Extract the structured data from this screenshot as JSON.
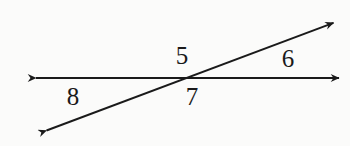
{
  "figure": {
    "background_color": "#fbfbfa",
    "stroke_color": "#1a1a1a",
    "canvas": {
      "width": 350,
      "height": 146
    },
    "intersection_point": {
      "x": 183,
      "y": 78
    },
    "lines": [
      {
        "name": "horizontal-line",
        "description": "double-headed horizontal line",
        "start": {
          "x": 30,
          "y": 78
        },
        "end": {
          "x": 345,
          "y": 78
        },
        "arrow_start": true,
        "arrow_end": true
      },
      {
        "name": "transversal-line",
        "description": "double-headed transversal rising to the right",
        "start": {
          "x": 40,
          "y": 133
        },
        "end": {
          "x": 340,
          "y": 20
        },
        "arrow_start": true,
        "arrow_end": true
      }
    ],
    "labels": [
      {
        "name": "angle-label-5",
        "text": "5",
        "x": 182,
        "y": 55,
        "position": "above-left-of-intersection"
      },
      {
        "name": "angle-label-6",
        "text": "6",
        "x": 288,
        "y": 58,
        "position": "above-right-of-intersection"
      },
      {
        "name": "angle-label-7",
        "text": "7",
        "x": 192,
        "y": 96,
        "position": "below-right-of-intersection"
      },
      {
        "name": "angle-label-8",
        "text": "8",
        "x": 73,
        "y": 96,
        "position": "below-left-of-intersection"
      }
    ]
  }
}
